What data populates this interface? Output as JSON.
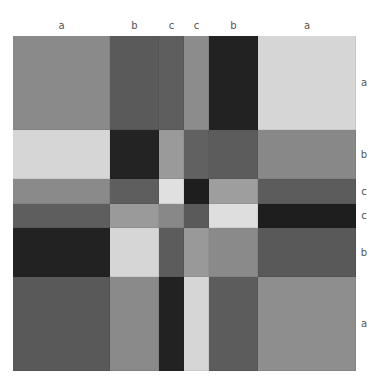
{
  "figure": {
    "column_labels": [
      "a",
      "b",
      "c",
      "c",
      "b",
      "a"
    ],
    "row_labels": [
      "a",
      "b",
      "c",
      "c",
      "b",
      "a"
    ],
    "column_edges": [
      13,
      110,
      159,
      184,
      209,
      258,
      356
    ],
    "row_edges": [
      36,
      130,
      179,
      204,
      228,
      277,
      371
    ],
    "cells": [
      [
        "#8a8a8a",
        "#5a5a5a",
        "#5e5e5e",
        "#8c8c8c",
        "#222222",
        "#d6d6d6"
      ],
      [
        "#d6d6d6",
        "#232323",
        "#9a9a9a",
        "#616161",
        "#5c5c5c",
        "#888888"
      ],
      [
        "#8a8a8a",
        "#5e5e5e",
        "#e0e0e0",
        "#1e1e1e",
        "#9e9e9e",
        "#5c5c5c"
      ],
      [
        "#5e5e5e",
        "#9a9a9a",
        "#888888",
        "#5a5a5a",
        "#dedede",
        "#1e1e1e"
      ],
      [
        "#222222",
        "#d6d6d6",
        "#5c5c5c",
        "#999999",
        "#8a8a8a",
        "#595959"
      ],
      [
        "#595959",
        "#8a8a8a",
        "#222222",
        "#d6d6d6",
        "#5c5c5c",
        "#8e8e8e"
      ]
    ]
  }
}
